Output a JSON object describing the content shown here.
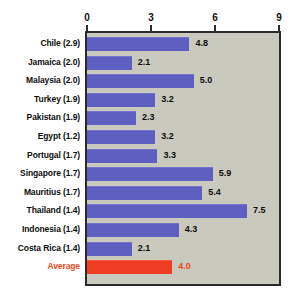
{
  "chart_data": {
    "type": "bar",
    "orientation": "horizontal",
    "title": "",
    "xlabel": "",
    "ylabel": "",
    "xlim": [
      0,
      9
    ],
    "xticks": [
      0,
      3,
      6,
      9
    ],
    "xtick_labels": [
      "0",
      "3",
      "6",
      "9"
    ],
    "grid": false,
    "legend": false,
    "categories": [
      "Chile (2.9)",
      "Jamaica (2.0)",
      "Malaysia (2.0)",
      "Turkey (1.9)",
      "Pakistan (1.9)",
      "Egypt (1.2)",
      "Portugal (1.7)",
      "Singapore (1.7)",
      "Mauritius (1.7)",
      "Thailand (1.4)",
      "Indonesia (1.4)",
      "Costa Rica (1.4)",
      "Average"
    ],
    "values": [
      4.8,
      2.1,
      5.0,
      3.2,
      2.3,
      3.2,
      3.3,
      5.9,
      5.4,
      7.5,
      4.3,
      2.1,
      4.0
    ],
    "value_labels": [
      "4.8",
      "2.1",
      "5.0",
      "3.2",
      "2.3",
      "3.2",
      "3.3",
      "5.9",
      "5.4",
      "7.5",
      "4.3",
      "2.1",
      "4.0"
    ],
    "highlight_index": 12,
    "colors": {
      "bar": "#5f5fc2",
      "bar_highlight": "#ee3d22",
      "plot_background": "#c9c9bd",
      "frame": "#2b2b2b",
      "label": "#0d0d0d",
      "label_highlight": "#ea4a22",
      "page_background": "#ffffff"
    }
  }
}
